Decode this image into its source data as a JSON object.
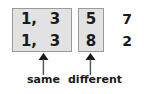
{
  "figure": {
    "title_visible": false,
    "background_color": "#ffffff",
    "box_fill_color": "#e2e2e2",
    "box_border_color": "#9a9a9a",
    "text_color": "#1a1a1a"
  },
  "groups": [
    {
      "id": "same-group",
      "boxed": true,
      "rows": [
        {
          "first": "1,",
          "second": "3"
        },
        {
          "first": "1,",
          "second": "3"
        }
      ],
      "annotation": {
        "arrow": "up-arrow",
        "label": "same"
      }
    },
    {
      "id": "different-group",
      "boxed": true,
      "rows": [
        {
          "value": "5"
        },
        {
          "value": "8"
        }
      ],
      "annotation": {
        "arrow": "up-arrow",
        "label": "different"
      }
    },
    {
      "id": "remainder-group",
      "boxed": false,
      "rows": [
        {
          "value": "7"
        },
        {
          "value": "2"
        }
      ],
      "annotation": {
        "arrow": null,
        "label": null
      }
    }
  ]
}
